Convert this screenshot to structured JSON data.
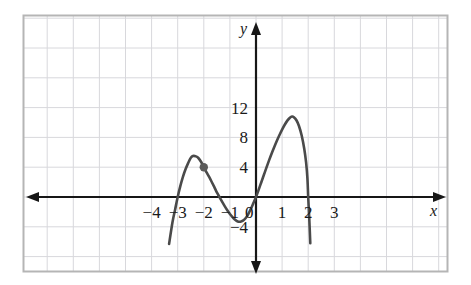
{
  "figure": {
    "background_color": "#ffffff",
    "frame": {
      "name": "plot-frame",
      "x": 23,
      "y": 15,
      "width": 425,
      "height": 257,
      "color": "#b5b5b5"
    },
    "grid": {
      "color": "#d8d8dc",
      "cell_width": 26.1,
      "cell_height": 29.8,
      "visible": true
    }
  },
  "chart_data": {
    "type": "line",
    "title": "",
    "subtitle": "",
    "xlabel": "x",
    "ylabel": "y",
    "xlim": [
      -4.9,
      3.9
    ],
    "ylim": [
      -6.1,
      14.4
    ],
    "grid": true,
    "legend": null,
    "legend_position": "none",
    "x_ticks": [
      -4,
      -3,
      -2,
      -1,
      0,
      1,
      2,
      3
    ],
    "x_tick_labels": [
      "−4",
      "−3",
      "−2",
      "−1",
      "0",
      "1",
      "2",
      "3"
    ],
    "y_ticks": [
      -4,
      4,
      8,
      12
    ],
    "y_tick_labels": [
      "−4",
      "4",
      "8",
      "12"
    ],
    "origin_label": "0",
    "axis_arrows": {
      "x_left": true,
      "x_right": true,
      "y_up": true,
      "y_down": true
    },
    "curve": {
      "name": "polynomial-curve",
      "color": "#4a4a4a",
      "width": 2.6,
      "x": [
        -3.35,
        -3.25,
        -3.15,
        -3.05,
        -2.95,
        -2.85,
        -2.75,
        -2.65,
        -2.55,
        -2.45,
        -2.35,
        -2.25,
        -2.15,
        -2.05,
        -1.95,
        -1.85,
        -1.75,
        -1.65,
        -1.55,
        -1.45,
        -1.35,
        -1.25,
        -1.15,
        -1.05,
        -0.95,
        -0.85,
        -0.75,
        -0.65,
        -0.55,
        -0.45,
        -0.35,
        -0.25,
        -0.15,
        -0.05,
        0.05,
        0.15,
        0.25,
        0.35,
        0.45,
        0.55,
        0.65,
        0.75,
        0.85,
        0.95,
        1.05,
        1.15,
        1.25,
        1.35,
        1.45,
        1.55,
        1.65,
        1.75,
        1.85,
        1.95,
        2.05,
        2.15,
        2.25
      ],
      "y": [
        -6.1,
        -3.55,
        -1.32,
        0.6,
        2.22,
        3.57,
        4.66,
        5.5,
        6.1,
        6.48,
        6.65,
        6.62,
        6.41,
        6.02,
        5.48,
        4.79,
        3.97,
        3.03,
        1.99,
        0.86,
        -0.34,
        -1.58,
        -2.85,
        -4.13,
        -5.4,
        -6.63,
        -7.82,
        -8.94,
        -9.97,
        -10.9,
        -11.71,
        -12.38,
        -12.9,
        -13.26,
        -13.43,
        -13.42,
        -13.21,
        -12.79,
        -12.16,
        -11.31,
        -10.23,
        -8.92,
        -7.37,
        -5.59,
        -3.57,
        -1.32,
        1.15,
        3.82,
        6.67,
        9.66,
        12.74,
        15.85,
        18.92,
        21.86,
        24.55,
        26.87,
        28.65
      ],
      "note": "y values listed are the raw polynomial; rendering uses the displayed scaled shape"
    },
    "marked_point": {
      "name": "marked-point",
      "x": -2,
      "y": 4,
      "color": "#5a5a5a",
      "radius": 4.2
    },
    "x_intercepts": [
      -3,
      -1.4,
      2
    ],
    "local_maxima": [
      {
        "x": -2.45,
        "y": 5.5
      },
      {
        "x": 1.35,
        "y": 10.8
      }
    ],
    "local_minima": [
      {
        "x": -0.7,
        "y": -3.3
      }
    ]
  }
}
